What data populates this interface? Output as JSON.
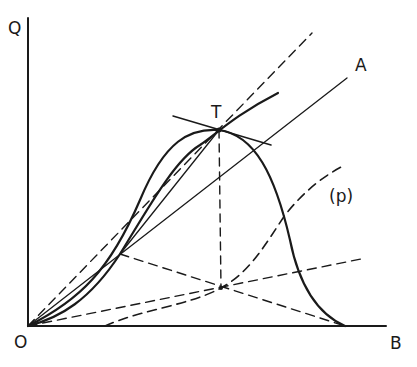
{
  "diagram": {
    "axes": {
      "y_label": "Q",
      "x_label": "B",
      "origin_label": "O"
    },
    "points": {
      "tangency_label": "T"
    },
    "lines": {
      "ray_label": "A"
    },
    "curves": {
      "dashed_curve_label": "(p)"
    },
    "colors": {
      "ink": "#1a1a1a",
      "background": "#ffffff"
    }
  }
}
